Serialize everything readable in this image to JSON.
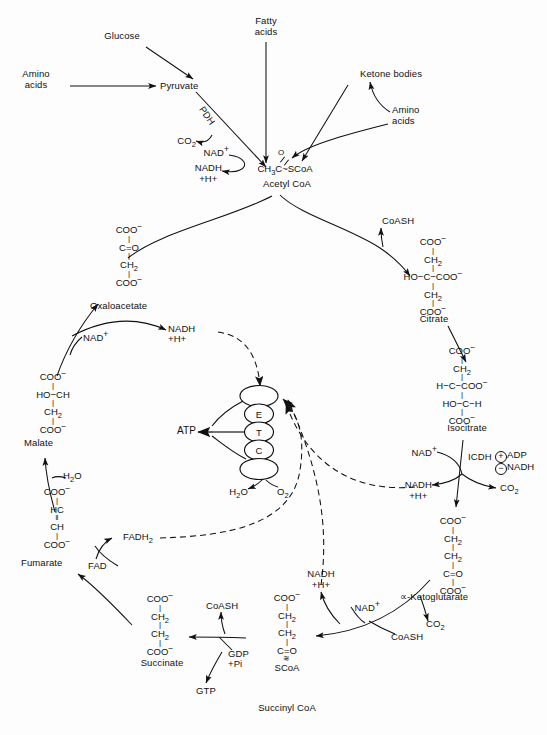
{
  "figure": {
    "type": "biochemical-pathway-diagram",
    "background_color": "#fdfdfd",
    "line_color": "#111111"
  },
  "inputs": {
    "glucose": "Glucose",
    "amino_acids_left": "Amino\nacids",
    "fatty_acids": "Fatty\nacids",
    "ketone_bodies": "Ketone bodies",
    "amino_acids_right": "Amino\nacids"
  },
  "metabolites": {
    "pyruvate": "Pyruvate",
    "acetyl_coa_name": "Acetyl CoA",
    "acetyl_coa_formula_left": "CH",
    "acetyl_coa_formula_sub": "3",
    "acetyl_coa_formula_right": "C~SCoA",
    "acetyl_coa_oxygen": "O",
    "oxaloacetate_name": "Oxaloacetate",
    "citrate_name": "Citrate",
    "isocitrate_name": "Isocitrate",
    "ketoglutarate_name": "∝-Ketoglutarate",
    "succinyl_coa_name": "Succinyl CoA",
    "succinate_name": "Succinate",
    "fumarate_name": "Fumarate",
    "malate_name": "Malate"
  },
  "structures": {
    "oxaloacetate": [
      "COO−",
      "C=O",
      "CH2",
      "COO−"
    ],
    "citrate": [
      "COO−",
      "CH2",
      "HO−C−COO−",
      "CH2",
      "COO−"
    ],
    "isocitrate": [
      "COO−",
      "CH2",
      "H−C−COO−",
      "HO−C−H",
      "COO−"
    ],
    "ketoglutarate": [
      "COO−",
      "CH2",
      "CH2",
      "C=O",
      "COO−"
    ],
    "succinyl_coa": [
      "COO−",
      "CH2",
      "CH2",
      "C=O",
      "SCoA"
    ],
    "succinate": [
      "COO−",
      "CH2",
      "CH2",
      "COO−"
    ],
    "fumarate": [
      "COO−",
      "HC",
      "CH",
      "COO−"
    ],
    "malate": [
      "COO−",
      "HO−CH",
      "CH2",
      "COO−"
    ]
  },
  "cofactors": {
    "nad_plus": "NAD",
    "nad_plus_charge": "+",
    "nadh": "NADH",
    "nadh_h": "+H+",
    "fad": "FAD",
    "fadh2": "FADH",
    "fadh2_sub": "2",
    "co2": "CO",
    "co2_sub": "2",
    "h2o": "H",
    "h2o_sub": "2",
    "h2o_tail": "O",
    "o2": "O",
    "o2_sub": "2",
    "coash": "CoASH",
    "gdp_pi": "GDP\n+Pi",
    "gtp": "GTP",
    "atp": "ATP"
  },
  "enzymes": {
    "pdh": "PDH",
    "icdh": "ICDH",
    "icdh_activator": "ADP",
    "icdh_activator_sign": "+",
    "icdh_inhibitor": "NADH",
    "icdh_inhibitor_sign": "−"
  },
  "etc": {
    "letters": [
      "E",
      "T",
      "C"
    ],
    "product": "ATP",
    "terminal_left": "H2O",
    "terminal_right": "O2",
    "node_count": 5
  },
  "labels_placed": [
    {
      "id": "glucose",
      "text": "Glucose",
      "x": 121,
      "y": 36
    },
    {
      "id": "amino-acids-left",
      "text": "Amino acids",
      "x": 30,
      "y": 74
    },
    {
      "id": "fatty-acids",
      "text": "Fatty acids",
      "x": 258,
      "y": 20
    },
    {
      "id": "ketone-bodies",
      "text": "Ketone bodies",
      "x": 345,
      "y": 72
    },
    {
      "id": "amino-acids-right",
      "text": "Amino acids",
      "x": 395,
      "y": 110
    },
    {
      "id": "pyruvate",
      "text": "Pyruvate",
      "x": 163,
      "y": 85
    },
    {
      "id": "pdh",
      "text": "PDH",
      "x": 209,
      "y": 108
    },
    {
      "id": "co2-pdh",
      "text": "CO2",
      "x": 180,
      "y": 141
    },
    {
      "id": "nad-pdh",
      "text": "NAD+",
      "x": 202,
      "y": 152
    },
    {
      "id": "nadh-pdh",
      "text": "NADH +H+",
      "x": 197,
      "y": 168
    },
    {
      "id": "acetyl-coa",
      "text": "Acetyl CoA",
      "x": 285,
      "y": 184
    },
    {
      "id": "coash-citrate",
      "text": "CoASH",
      "x": 385,
      "y": 222
    },
    {
      "id": "oxaloacetate",
      "text": "Oxaloacetate",
      "x": 88,
      "y": 306
    },
    {
      "id": "citrate",
      "text": "Citrate",
      "x": 434,
      "y": 319
    },
    {
      "id": "isocitrate",
      "text": "Isocitrate",
      "x": 455,
      "y": 428
    },
    {
      "id": "icdh",
      "text": "ICDH",
      "x": 477,
      "y": 456
    },
    {
      "id": "ketoglutarate",
      "text": "∝-Ketoglutarate",
      "x": 401,
      "y": 597
    },
    {
      "id": "succinyl-coa",
      "text": "Succinyl CoA",
      "x": 246,
      "y": 708
    },
    {
      "id": "succinate",
      "text": "Succinate",
      "x": 136,
      "y": 663
    },
    {
      "id": "fumarate",
      "text": "Fumarate",
      "x": 23,
      "y": 563
    },
    {
      "id": "malate",
      "text": "Malate",
      "x": 24,
      "y": 443
    },
    {
      "id": "atp",
      "text": "ATP",
      "x": 189,
      "y": 425
    }
  ]
}
